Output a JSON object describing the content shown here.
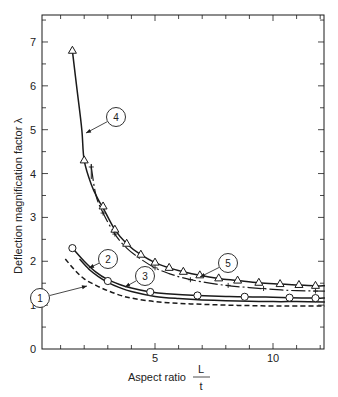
{
  "chart_data": {
    "type": "line",
    "title": "",
    "xlabel": "Aspect ratio L/t",
    "xlabel_main": "Aspect ratio",
    "xlabel_frac_num": "L",
    "xlabel_frac_den": "t",
    "ylabel": "Deflection magnification factor λ",
    "xlim": [
      0.2,
      12.2
    ],
    "ylim": [
      0,
      7.6
    ],
    "x_ticks": [
      5,
      10
    ],
    "x_tick_labels": [
      "5",
      "10"
    ],
    "y_ticks": [
      0,
      1,
      2,
      3,
      4,
      5,
      6,
      7
    ],
    "y_tick_labels": [
      "0",
      "1",
      "2",
      "3",
      "4",
      "5",
      "6",
      "7"
    ],
    "grid": false,
    "legend": "callouts",
    "series": [
      {
        "name": "1",
        "style": "dashed",
        "marker": "none",
        "x": [
          1.2,
          1.6,
          2.0,
          2.5,
          3.0,
          3.5,
          4.0,
          5.0,
          6.0,
          7.0,
          8.0,
          9.0,
          10.0,
          11.0,
          12.2
        ],
        "y": [
          2.05,
          1.8,
          1.6,
          1.45,
          1.33,
          1.23,
          1.16,
          1.08,
          1.04,
          1.02,
          1.0,
          0.99,
          0.98,
          0.98,
          0.98
        ]
      },
      {
        "name": "2",
        "style": "solid",
        "marker": "circle",
        "x": [
          1.5,
          2.0,
          2.5,
          3.0,
          3.5,
          4.0,
          4.8,
          5.5,
          6.8,
          8.0,
          8.8,
          10.0,
          10.7,
          11.8,
          12.2
        ],
        "y": [
          2.3,
          2.0,
          1.75,
          1.58,
          1.47,
          1.39,
          1.3,
          1.26,
          1.22,
          1.2,
          1.19,
          1.18,
          1.17,
          1.16,
          1.16
        ],
        "marker_x": [
          1.5,
          3.0,
          4.8,
          6.8,
          8.8,
          10.7,
          11.8
        ],
        "marker_y": [
          2.3,
          1.55,
          1.3,
          1.22,
          1.19,
          1.17,
          1.16
        ]
      },
      {
        "name": "3",
        "style": "solid",
        "marker": "none",
        "x": [
          1.8,
          2.2,
          2.6,
          3.0,
          3.5,
          4.0,
          5.0,
          6.0,
          7.0,
          8.0,
          9.0,
          10.0,
          11.0,
          12.2
        ],
        "y": [
          2.05,
          1.82,
          1.65,
          1.52,
          1.4,
          1.31,
          1.2,
          1.15,
          1.12,
          1.1,
          1.09,
          1.08,
          1.08,
          1.07
        ]
      },
      {
        "name": "4",
        "style": "solid",
        "marker": "triangle",
        "x": [
          1.5,
          1.7,
          1.9,
          2.0,
          2.3,
          2.6,
          2.8,
          3.3,
          3.8,
          4.4,
          5.0,
          5.6,
          6.2,
          6.9,
          7.7,
          8.5,
          9.4,
          10.3,
          11.1,
          11.8,
          12.2
        ],
        "y": [
          6.8,
          5.9,
          5.0,
          4.3,
          3.75,
          3.4,
          3.22,
          2.72,
          2.4,
          2.15,
          1.97,
          1.85,
          1.76,
          1.68,
          1.61,
          1.56,
          1.51,
          1.48,
          1.46,
          1.44,
          1.44
        ],
        "marker_x": [
          1.5,
          2.0,
          2.8,
          3.3,
          3.8,
          4.4,
          5.0,
          5.6,
          6.2,
          6.9,
          7.7,
          8.5,
          9.4,
          10.3,
          11.1,
          11.8
        ],
        "marker_y": [
          6.8,
          4.3,
          3.25,
          2.72,
          2.4,
          2.15,
          1.97,
          1.85,
          1.76,
          1.68,
          1.61,
          1.56,
          1.51,
          1.48,
          1.46,
          1.44
        ]
      },
      {
        "name": "5",
        "style": "dash-dot",
        "marker": "plus",
        "x": [
          2.3,
          2.5,
          2.8,
          3.3,
          3.8,
          4.4,
          5.0,
          5.6,
          6.2,
          7.0,
          8.0,
          9.0,
          10.0,
          11.0,
          12.2
        ],
        "y": [
          4.15,
          3.5,
          3.1,
          2.62,
          2.3,
          2.05,
          1.85,
          1.72,
          1.62,
          1.53,
          1.45,
          1.4,
          1.36,
          1.33,
          1.32
        ],
        "marker_x": [
          2.3,
          2.8,
          3.3,
          5.0,
          6.5,
          8.1,
          9.6,
          11.8
        ],
        "marker_y": [
          4.15,
          3.1,
          2.62,
          1.85,
          1.58,
          1.45,
          1.38,
          1.32
        ]
      }
    ],
    "annotations": [
      {
        "label": "1",
        "cx": 40,
        "cy": 298,
        "target": [
          87,
          286
        ]
      },
      {
        "label": "2",
        "cx": 108,
        "cy": 259,
        "target": [
          89,
          268
        ]
      },
      {
        "label": "3",
        "cx": 145,
        "cy": 276,
        "target": [
          125,
          287
        ]
      },
      {
        "label": "4",
        "cx": 116,
        "cy": 117,
        "target": [
          86,
          133
        ]
      },
      {
        "label": "5",
        "cx": 228,
        "cy": 263,
        "target": [
          200,
          277
        ]
      }
    ]
  }
}
